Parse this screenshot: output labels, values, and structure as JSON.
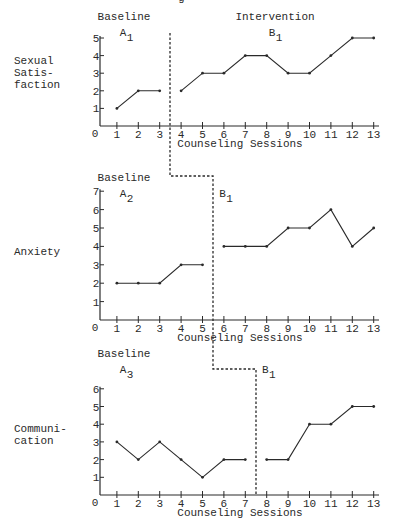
{
  "page": {
    "top_fragment": "g"
  },
  "chart_data": [
    {
      "type": "line",
      "title": "",
      "ylabel": "Sexual\nSatis-\nfaction",
      "xlabel": "Counseling Sessions",
      "ylim": [
        0,
        5
      ],
      "yticks": [
        0,
        1,
        2,
        3,
        4,
        5
      ],
      "xticks": [
        0,
        1,
        2,
        3,
        4,
        5,
        6,
        7,
        8,
        9,
        10,
        11,
        12,
        13
      ],
      "grid": false,
      "phases": [
        {
          "name": "Baseline",
          "label": "A",
          "sub": "1",
          "x": [
            1,
            2,
            3
          ],
          "values": [
            1,
            2,
            2
          ]
        },
        {
          "name": "Intervention",
          "label": "B",
          "sub": "1",
          "x": [
            4,
            5,
            6,
            7,
            8,
            9,
            10,
            11,
            12,
            13
          ],
          "values": [
            2,
            3,
            3,
            4,
            4,
            3,
            3,
            4,
            5,
            5
          ]
        }
      ],
      "phase_change_after_session": 3
    },
    {
      "type": "line",
      "title": "",
      "ylabel": "Anxiety",
      "xlabel": "Counseling Sessions",
      "ylim": [
        0,
        7
      ],
      "yticks": [
        0,
        1,
        2,
        3,
        4,
        5,
        6,
        7
      ],
      "xticks": [
        0,
        1,
        2,
        3,
        4,
        5,
        6,
        7,
        8,
        9,
        10,
        11,
        12,
        13
      ],
      "grid": false,
      "phases": [
        {
          "name": "Baseline",
          "label": "A",
          "sub": "2",
          "x": [
            1,
            2,
            3,
            4,
            5
          ],
          "values": [
            2,
            2,
            2,
            3,
            3
          ]
        },
        {
          "name": "",
          "label": "B",
          "sub": "1",
          "x": [
            6,
            7,
            8,
            9,
            10,
            11,
            12,
            13
          ],
          "values": [
            4,
            4,
            4,
            5,
            5,
            6,
            4,
            5
          ]
        }
      ],
      "phase_change_after_session": 5
    },
    {
      "type": "line",
      "title": "",
      "ylabel": "Communi-\ncation",
      "xlabel": "Counseling Sessions",
      "ylim": [
        0,
        6
      ],
      "yticks": [
        0,
        1,
        2,
        3,
        4,
        5,
        6
      ],
      "xticks": [
        0,
        1,
        2,
        3,
        4,
        5,
        6,
        7,
        8,
        9,
        10,
        11,
        12,
        13
      ],
      "grid": false,
      "phases": [
        {
          "name": "Baseline",
          "label": "A",
          "sub": "3",
          "x": [
            1,
            2,
            3,
            4,
            5,
            6,
            7
          ],
          "values": [
            3,
            2,
            3,
            2,
            1,
            2,
            2
          ]
        },
        {
          "name": "",
          "label": "B",
          "sub": "1",
          "x": [
            8,
            9,
            10,
            11,
            12,
            13
          ],
          "values": [
            2,
            2,
            4,
            4,
            5,
            5
          ]
        }
      ],
      "phase_change_after_session": 7
    }
  ]
}
